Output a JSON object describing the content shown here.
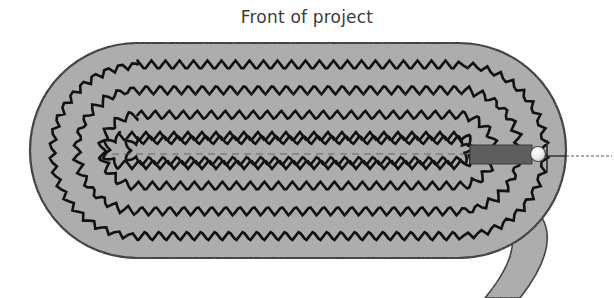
{
  "page": {
    "width": 614,
    "height": 298,
    "background": "#ffffff"
  },
  "title": {
    "text": "Front of project",
    "color": "#3b3b3b",
    "align": "center"
  },
  "diagram": {
    "name": "coiled-rope-basket-top-view",
    "colors": {
      "fabric_fill": "#ababab",
      "fabric_outline": "#1a1a1a",
      "stitch": "#111111",
      "strap_bar": "#5e5e5e",
      "bead": "#f2f2f2",
      "bead_outline": "#4a4a4a",
      "leader_line": "#555555",
      "center_dash": "#5a5a5a",
      "background": "#ffffff"
    },
    "oval": {
      "left": 30,
      "top": 43,
      "right": 566,
      "bottom": 258,
      "corner_radius": 107
    },
    "coil": {
      "turns": 4,
      "zigzag_rows_across_center": 8,
      "row_spacing_px": 25,
      "zigzag_period_px": 14,
      "zigzag_amplitude_px": 4.5
    },
    "center_line": {
      "style": "dashed",
      "x_start": 112,
      "x_end": 470,
      "y": 154
    },
    "strap": {
      "bar_left": 470,
      "bar_right": 532,
      "bar_top": 145,
      "bar_bottom": 164,
      "tail_exit": "bottom-right"
    },
    "bead": {
      "cx": 538,
      "cy": 154,
      "r": 7
    },
    "leader_line": {
      "x_start": 566,
      "x_end": 610,
      "y": 156
    }
  },
  "labels": {
    "front_of_project": "Front of project"
  }
}
